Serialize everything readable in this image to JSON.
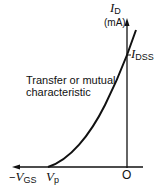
{
  "diagram": {
    "type": "jfet-transfer-characteristic",
    "y_axis": {
      "symbol": "I",
      "subscript": "D",
      "unit": "(mA)"
    },
    "x_axis": {
      "prefix": "−",
      "symbol": "V",
      "subscript": "GS"
    },
    "origin_label": "O",
    "pinch_off": {
      "symbol": "V",
      "subscript": "p"
    },
    "saturation_current": {
      "symbol": "I",
      "subscript": "DSS"
    },
    "curve_label_line1": "Transfer or mutual",
    "curve_label_line2": "characteristic",
    "colors": {
      "line": "#111111",
      "background": "#ffffff"
    }
  }
}
